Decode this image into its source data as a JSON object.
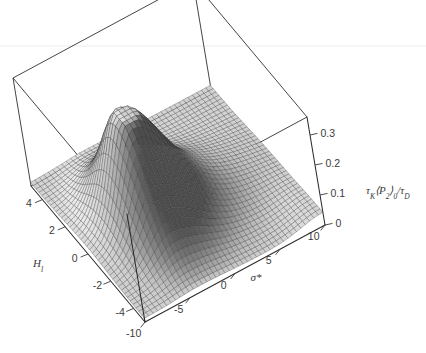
{
  "figure": {
    "kind": "3d-surface-plot",
    "background_color": "#ffffff",
    "line_color": "#2b2b2b",
    "text_color": "#3a3a3a"
  },
  "chart_data": {
    "type": "surface",
    "title": "",
    "xlabel": "σ*",
    "ylabel": "Hₗ",
    "zlabel": "τₖ⟨P₂⟩₀/τᴅ",
    "xlim": [
      -10,
      10
    ],
    "ylim": [
      -5,
      5
    ],
    "zlim": [
      0,
      0.36
    ],
    "xticks": [
      -10,
      -5,
      0,
      5,
      10
    ],
    "xtick_labels": [
      "-10",
      "-5",
      "0",
      "5",
      "10"
    ],
    "yticks": [
      4,
      2,
      0,
      -2,
      -4
    ],
    "ytick_labels": [
      "4",
      "2",
      "0",
      "-2",
      "-4"
    ],
    "zticks": [
      0,
      0.1,
      0.2,
      0.3
    ],
    "ztick_labels": [
      "0",
      "0.1",
      "0.2",
      "0.3"
    ],
    "grid": false,
    "legend": "none",
    "colormap": "grayscale",
    "mesh_nx": 41,
    "mesh_ny": 41,
    "surface_model": {
      "form": "z = A*exp(-((x - x0)/wx)^2) * (1/(1 + exp(-(x - xs)/ss))) scaled ridge along y with mild broadening",
      "peak_value": 0.345,
      "peak_x": -4.0,
      "peak_y": 0.0,
      "plateau_value": 0.012,
      "ridge_half_width_x": 3.2,
      "y_broadening": 0.55
    },
    "sample_profile_at_y0": {
      "x": [
        -10,
        -8,
        -6,
        -4,
        -2,
        0,
        2,
        4,
        6,
        8,
        10
      ],
      "z": [
        0.02,
        0.11,
        0.27,
        0.345,
        0.3,
        0.2,
        0.115,
        0.06,
        0.032,
        0.018,
        0.012
      ]
    },
    "sample_profile_at_x_peak": {
      "y": [
        -5,
        -4,
        -3,
        -2,
        -1,
        0,
        1,
        2,
        3,
        4,
        5
      ],
      "z": [
        0.05,
        0.09,
        0.16,
        0.25,
        0.32,
        0.345,
        0.32,
        0.25,
        0.16,
        0.09,
        0.05
      ]
    }
  },
  "axis_labels": {
    "x_axis_name": "sigma-star-axis",
    "y_axis_name": "H-l-axis",
    "z_axis_name": "tau-k-p2-tau-d-axis"
  }
}
